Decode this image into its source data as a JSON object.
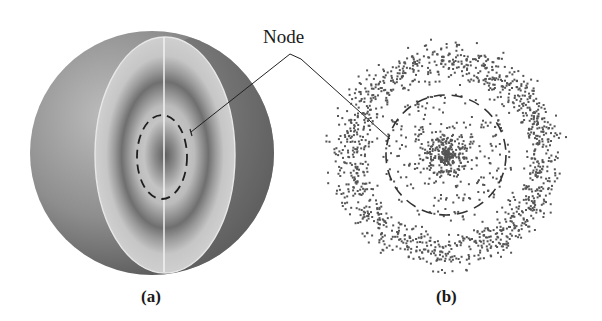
{
  "figure": {
    "annotation": {
      "text": "Node"
    },
    "panels": [
      {
        "id": "a",
        "label": "(a)",
        "description": "3D sphere cutaway showing concentric shaded bands with a dashed nodal surface"
      },
      {
        "id": "b",
        "label": "(b)",
        "description": "Dot-density cross section with dense core, dashed nodal circle, and outer dense ring"
      }
    ]
  },
  "colors": {
    "background": "#ffffff",
    "sphere_dark": "#5a5a5a",
    "sphere_light": "#b8b8b8",
    "cut_face": "#c9c9c9",
    "band_dark": "#6e6e6e",
    "dot": "#555555",
    "line": "#222222"
  }
}
